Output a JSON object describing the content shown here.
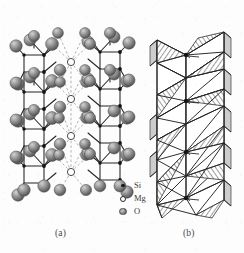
{
  "figure": {
    "panels": [
      {
        "id": "a",
        "label": "(a)",
        "kind": "ball-and-stick-crystal-structure"
      },
      {
        "id": "b",
        "label": "(b)",
        "kind": "polyhedral-crystal-structure"
      }
    ]
  },
  "legend": {
    "items": [
      {
        "symbol": "Si",
        "marker": "small-filled-black-dot",
        "color": "#1a1a1a"
      },
      {
        "symbol": "Mg",
        "marker": "open-white-circle",
        "color": "#ffffff"
      },
      {
        "symbol": "O",
        "marker": "shaded-gray-sphere",
        "color": "#8c8c8c"
      }
    ]
  },
  "style": {
    "background": "#fdfdfd",
    "line": "#2b2b2b",
    "dashed_bond": "#9a9a9a",
    "oxygen_sphere": "#8c8c8c",
    "silicon_dot": "#1a1a1a",
    "magnesium_circle": "#ffffff",
    "hatch": "#3a3a3a",
    "face_light": "#ffffff",
    "face_shadow": "#cfcfcf"
  }
}
